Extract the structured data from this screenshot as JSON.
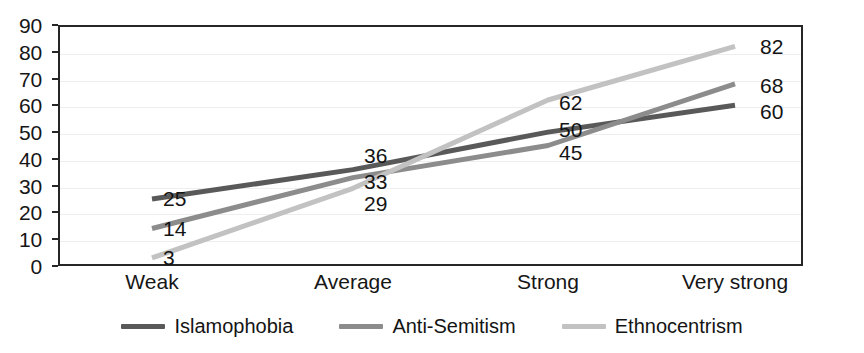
{
  "chart_data": {
    "type": "line",
    "title": "",
    "subtitle": "",
    "xlabel": "",
    "ylabel": "",
    "categories": [
      "Weak",
      "Average",
      "Strong",
      "Very strong"
    ],
    "series": [
      {
        "name": "Islamophobia",
        "color": "#595959",
        "values": [
          25,
          36,
          50,
          60
        ]
      },
      {
        "name": "Anti-Semitism",
        "color": "#8c8c8c",
        "values": [
          14,
          33,
          45,
          68
        ]
      },
      {
        "name": "Ethnocentrism",
        "color": "#c2c2c2",
        "values": [
          3,
          29,
          62,
          82
        ]
      }
    ],
    "ylim": [
      0,
      90
    ],
    "ytick_step": 10,
    "yticks": [
      "90",
      "80",
      "70",
      "60",
      "50",
      "40",
      "30",
      "20",
      "10",
      "0"
    ],
    "grid": true,
    "grid_axis": "y",
    "legend_position": "bottom",
    "data_labels": true,
    "annotations": [
      {
        "category": "Weak",
        "series": "Islamophobia",
        "text": "25"
      },
      {
        "category": "Weak",
        "series": "Anti-Semitism",
        "text": "14"
      },
      {
        "category": "Weak",
        "series": "Ethnocentrism",
        "text": "3"
      },
      {
        "category": "Average",
        "series": "Islamophobia",
        "text": "36"
      },
      {
        "category": "Average",
        "series": "Anti-Semitism",
        "text": "33"
      },
      {
        "category": "Average",
        "series": "Ethnocentrism",
        "text": "29"
      },
      {
        "category": "Strong",
        "series": "Ethnocentrism",
        "text": "62"
      },
      {
        "category": "Strong",
        "series": "Islamophobia",
        "text": "50"
      },
      {
        "category": "Strong",
        "series": "Anti-Semitism",
        "text": "45"
      },
      {
        "category": "Very strong",
        "series": "Ethnocentrism",
        "text": "82"
      },
      {
        "category": "Very strong",
        "series": "Anti-Semitism",
        "text": "68"
      },
      {
        "category": "Very strong",
        "series": "Islamophobia",
        "text": "60"
      }
    ]
  },
  "axes": {
    "y_ticks": [
      "90",
      "80",
      "70",
      "60",
      "50",
      "40",
      "30",
      "20",
      "10",
      "0"
    ],
    "x_ticks": [
      "Weak",
      "Average",
      "Strong",
      "Very strong"
    ]
  },
  "legend": {
    "items": [
      {
        "label": "Islamophobia",
        "color": "#595959"
      },
      {
        "label": "Anti-Semitism",
        "color": "#8c8c8c"
      },
      {
        "label": "Ethnocentrism",
        "color": "#c2c2c2"
      }
    ]
  },
  "value_labels": [
    {
      "text": "25",
      "x": 163,
      "y": 198
    },
    {
      "text": "14",
      "x": 163,
      "y": 228
    },
    {
      "text": "3",
      "x": 163,
      "y": 257
    },
    {
      "text": "36",
      "x": 364,
      "y": 155
    },
    {
      "text": "33",
      "x": 364,
      "y": 181
    },
    {
      "text": "29",
      "x": 364,
      "y": 203
    },
    {
      "text": "62",
      "x": 559,
      "y": 102
    },
    {
      "text": "50",
      "x": 559,
      "y": 129
    },
    {
      "text": "45",
      "x": 559,
      "y": 152
    },
    {
      "text": "82",
      "x": 760,
      "y": 46
    },
    {
      "text": "68",
      "x": 760,
      "y": 85
    },
    {
      "text": "60",
      "x": 760,
      "y": 111
    }
  ]
}
